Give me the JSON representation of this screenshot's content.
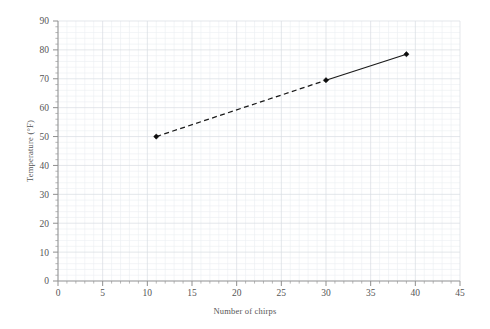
{
  "chart_data": {
    "type": "line",
    "title": "",
    "subtitle": "",
    "xlabel": "Number of chirps",
    "ylabel": "Temperature (°F)",
    "xlim": [
      0,
      45
    ],
    "ylim": [
      0,
      90
    ],
    "x_ticks": [
      0,
      5,
      10,
      15,
      20,
      25,
      30,
      35,
      40,
      45
    ],
    "y_ticks": [
      0,
      10,
      20,
      30,
      40,
      50,
      60,
      70,
      80,
      90
    ],
    "x_tick_labels": [
      "0",
      "5",
      "10",
      "15",
      "20",
      "25",
      "30",
      "35",
      "40",
      "45"
    ],
    "y_tick_labels": [
      "0",
      "10",
      "20",
      "30",
      "40",
      "50",
      "60",
      "70",
      "80",
      "90"
    ],
    "x_minor_step": 1,
    "y_minor_step": 2,
    "grid": true,
    "grid_axes": "both",
    "legend": false,
    "legend_position": "none",
    "marker": "diamond",
    "series": [
      {
        "name": "Chirps vs Temperature",
        "x": [
          11,
          30,
          39
        ],
        "y": [
          50,
          69.5,
          78.5
        ],
        "segments": [
          {
            "from": 0,
            "to": 1,
            "style": "dashed"
          },
          {
            "from": 1,
            "to": 2,
            "style": "solid"
          }
        ],
        "color": "#1a1a1a"
      }
    ],
    "annotations": [],
    "colors": {
      "line": "#1a1a1a",
      "marker": "#0d0d0d",
      "grid_major": "#d8dde3",
      "grid_minor": "#ebeef1",
      "axis": "#9b9b9b",
      "text": "#555555",
      "background": "#ffffff"
    }
  },
  "plot_geometry": {
    "left": 58,
    "right": 460,
    "top": 21,
    "bottom": 281
  }
}
